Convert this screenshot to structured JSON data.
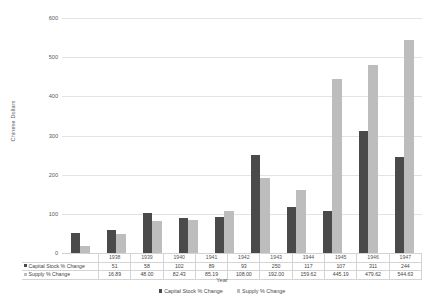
{
  "chart_data": {
    "type": "bar",
    "title": "",
    "xlabel": "Year",
    "ylabel": "Chinese Dollars",
    "categories": [
      "1938",
      "1939",
      "1940",
      "1941",
      "1942",
      "1943",
      "1944",
      "1945",
      "1946",
      "1947"
    ],
    "series": [
      {
        "name": "Capital Stock % Change",
        "color": "#4a4a4a",
        "values": [
          51,
          58,
          102,
          89,
          93,
          250,
          117,
          107,
          311,
          244
        ]
      },
      {
        "name": "Supply % Change",
        "color": "#bdbdbd",
        "values": [
          16.89,
          48.0,
          82.43,
          85.19,
          108.0,
          192.0,
          159.62,
          445.19,
          479.62,
          544.63
        ]
      }
    ],
    "ylim": [
      0,
      600
    ],
    "yticks": [
      0,
      100,
      200,
      300,
      400,
      500,
      600
    ],
    "ytick_labels": [
      "0",
      "100",
      "200",
      "300",
      "400",
      "500",
      "600"
    ],
    "grid": true,
    "legend_position": "bottom",
    "table": {
      "row_labels": [
        "Capital Stock % Change",
        "Supply % Change"
      ],
      "rows": [
        [
          "51",
          "58",
          "102",
          "89",
          "93",
          "250",
          "117",
          "107",
          "311",
          "244"
        ],
        [
          "16.89",
          "48.00",
          "82.43",
          "85.19",
          "108.00",
          "192.00",
          "159.62",
          "445.19",
          "479.62",
          "544.63"
        ]
      ]
    }
  },
  "legend": {
    "items": [
      {
        "label": "Capital Stock % Change"
      },
      {
        "label": "Supply % Change"
      }
    ]
  }
}
